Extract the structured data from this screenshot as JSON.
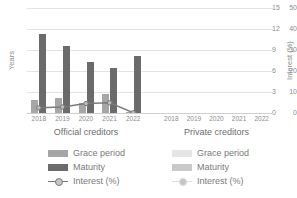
{
  "chart_data": {
    "type": "bar",
    "title": "",
    "subtitle": "",
    "ylabel": "Years",
    "y2label": "Interest (%)",
    "xlabel": "",
    "ylim": [
      0,
      50
    ],
    "y2lim": [
      0,
      15
    ],
    "yticks": [
      0,
      10,
      20,
      30,
      40,
      50
    ],
    "y2ticks": [
      0,
      3,
      6,
      9,
      12,
      15
    ],
    "grid": true,
    "legend_position": "bottom",
    "panels": [
      {
        "name": "Official creditors",
        "categories": [
          "2018",
          "2019",
          "2020",
          "2021",
          "2022"
        ],
        "series": [
          {
            "name": "Grace period",
            "axis": "left",
            "type": "bar",
            "color": "#a6a6a6",
            "values": [
              6.2,
              7.0,
              5.0,
              9.2,
              0.6
            ]
          },
          {
            "name": "Maturity",
            "axis": "left",
            "type": "bar",
            "color": "#6b6b6b",
            "values": [
              37.8,
              31.8,
              24.2,
              21.6,
              27.2
            ]
          },
          {
            "name": "Interest (%)",
            "axis": "right",
            "type": "line",
            "color": "#7a7a7a",
            "values": [
              0.75,
              0.85,
              1.35,
              1.45,
              0.05
            ]
          }
        ]
      },
      {
        "name": "Private creditors",
        "categories": [
          "2018",
          "2019",
          "2020",
          "2021",
          "2022"
        ],
        "series": [
          {
            "name": "Grace period",
            "axis": "left",
            "type": "bar",
            "color": "#e0e0e0",
            "values": [
              0,
              0,
              0,
              0,
              0
            ]
          },
          {
            "name": "Maturity",
            "axis": "left",
            "type": "bar",
            "color": "#c4c4c4",
            "values": [
              0,
              0,
              0,
              0,
              0
            ]
          },
          {
            "name": "Interest (%)",
            "axis": "right",
            "type": "line",
            "color": "#d8d8d8",
            "values": [
              0,
              0,
              0,
              0,
              0
            ]
          }
        ]
      }
    ]
  },
  "axes": {
    "left_title": "Years",
    "right_title": "Interest (%)",
    "left_ticks": [
      "50",
      "40",
      "30",
      "20",
      "10",
      "0"
    ],
    "right_ticks": [
      "15",
      "12",
      "9",
      "6",
      "3",
      "0"
    ]
  },
  "panels": {
    "left": {
      "title": "Official creditors",
      "xticks": [
        "2018",
        "2019",
        "2020",
        "2021",
        "2022"
      ],
      "legend": [
        {
          "label": "Grace period",
          "color": "#a6a6a6",
          "kind": "swatch"
        },
        {
          "label": "Maturity",
          "color": "#6b6b6b",
          "kind": "swatch"
        },
        {
          "label": "Interest (%)",
          "color": "#7a7a7a",
          "kind": "line-marker"
        }
      ]
    },
    "right": {
      "title": "Private creditors",
      "xticks": [
        "2018",
        "2019",
        "2020",
        "2021",
        "2022"
      ],
      "legend": [
        {
          "label": "Grace period",
          "color": "#e6e6e6",
          "kind": "swatch"
        },
        {
          "label": "Maturity",
          "color": "#c9c9c9",
          "kind": "swatch"
        },
        {
          "label": "Interest (%)",
          "color": "#dcdcdc",
          "kind": "line-marker"
        }
      ]
    }
  }
}
